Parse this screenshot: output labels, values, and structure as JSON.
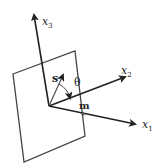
{
  "diagram": {
    "type": "coordinate-system-with-plane",
    "colors": {
      "stroke": "#333333",
      "text": "#222222",
      "background": "#ffffff"
    },
    "axes": [
      {
        "id": "x1",
        "label": "x",
        "subscript": "1"
      },
      {
        "id": "x2",
        "label": "x",
        "subscript": "2"
      },
      {
        "id": "x3",
        "label": "x",
        "subscript": "3"
      }
    ],
    "vectors": {
      "s": {
        "label": "s"
      },
      "m": {
        "label": "m"
      }
    },
    "angle": {
      "label": "θ"
    },
    "plane": {
      "description": "tilted rectangular plane through origin"
    }
  }
}
